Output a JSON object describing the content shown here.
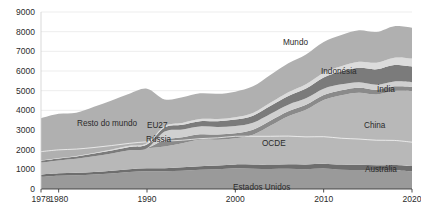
{
  "chart_data": {
    "type": "area",
    "stacked": true,
    "title": "",
    "subtitle": "",
    "xlabel": "",
    "ylabel": "",
    "xlim": [
      1978,
      2020
    ],
    "ylim": [
      0,
      9000
    ],
    "grid": true,
    "legend_position": "inline-labels",
    "x_ticks": [
      "1978",
      "1980",
      "1990",
      "2000",
      "2010",
      "2020"
    ],
    "x_tick_values": [
      1978,
      1980,
      1990,
      2000,
      2010,
      2020
    ],
    "y_ticks": [
      "0",
      "1000",
      "2000",
      "3000",
      "4000",
      "5000",
      "6000",
      "7000",
      "8000",
      "9000"
    ],
    "y_tick_values": [
      0,
      1000,
      2000,
      3000,
      4000,
      5000,
      6000,
      7000,
      8000,
      9000
    ],
    "x": [
      1978,
      1980,
      1982,
      1984,
      1986,
      1988,
      1990,
      1992,
      1994,
      1996,
      1998,
      2000,
      2002,
      2004,
      2006,
      2008,
      2010,
      2012,
      2014,
      2016,
      2018,
      2020
    ],
    "series": [
      {
        "name": "Estados Unidos",
        "color": "#9a9a9a",
        "label_color": "#2b2b2b",
        "values": [
          620,
          680,
          700,
          740,
          790,
          860,
          900,
          900,
          930,
          980,
          1000,
          1050,
          1030,
          1020,
          1030,
          1010,
          1040,
          980,
          960,
          930,
          940,
          900
        ]
      },
      {
        "name": "Austrália",
        "color": "#6e6e6e",
        "label_color": "#f2f2f2",
        "values": [
          110,
          115,
          120,
          130,
          140,
          150,
          155,
          160,
          170,
          180,
          190,
          200,
          210,
          220,
          230,
          240,
          250,
          260,
          270,
          275,
          280,
          270
        ]
      },
      {
        "name": "China",
        "color": "#b8b8b8",
        "label_color": "#2b2b2b",
        "values": [
          620,
          660,
          720,
          800,
          880,
          960,
          1020,
          1100,
          1230,
          1340,
          1320,
          1330,
          1520,
          1990,
          2440,
          2780,
          3240,
          3530,
          3670,
          3600,
          3760,
          3800
        ]
      },
      {
        "name": "Rússia",
        "color": "#8a8a8a",
        "label_color": "#2b2b2b",
        "values": [
          0,
          0,
          0,
          0,
          0,
          0,
          0,
          340,
          300,
          280,
          260,
          250,
          250,
          250,
          250,
          250,
          250,
          250,
          250,
          240,
          240,
          230
        ]
      },
      {
        "name": "EU27",
        "color": "#d0d0d0",
        "label_color": "#2b2b2b",
        "values": [
          0,
          0,
          0,
          0,
          0,
          0,
          0,
          420,
          400,
          400,
          380,
          370,
          360,
          350,
          340,
          330,
          320,
          300,
          280,
          260,
          250,
          230
        ]
      },
      {
        "name": "Índia",
        "color": "#7b7b7b",
        "label_color": "#2b2b2b",
        "values": [
          80,
          90,
          110,
          130,
          150,
          170,
          190,
          210,
          240,
          270,
          300,
          330,
          360,
          400,
          440,
          500,
          570,
          650,
          730,
          780,
          830,
          800
        ]
      },
      {
        "name": "Indonésia",
        "color": "#dcdcdc",
        "label_color": "#2b2b2b",
        "values": [
          20,
          25,
          30,
          35,
          45,
          55,
          65,
          75,
          90,
          105,
          110,
          120,
          140,
          165,
          190,
          215,
          245,
          275,
          310,
          340,
          380,
          400
        ]
      },
      {
        "name": "Resto do mundo",
        "color": "#b0b0b0",
        "label_color": "#2b2b2b",
        "values": [
          2150,
          2250,
          2200,
          2350,
          2500,
          2650,
          2770,
          1350,
          1300,
          1310,
          1280,
          1300,
          1350,
          1420,
          1480,
          1520,
          1560,
          1580,
          1600,
          1560,
          1600,
          1570
        ]
      }
    ],
    "annotations": [
      {
        "text": "Mundo",
        "note": "top boundary of total stack"
      },
      {
        "text": "OCDE",
        "note": "white dividing line inside stack"
      }
    ],
    "ocde_line": {
      "name": "OCDE",
      "color": "#ffffff",
      "values": [
        1900,
        1990,
        2030,
        2110,
        2210,
        2320,
        2400,
        2430,
        2480,
        2560,
        2600,
        2680,
        2680,
        2680,
        2690,
        2650,
        2660,
        2580,
        2540,
        2480,
        2470,
        2380
      ]
    },
    "label_positions": [
      {
        "key": "resto-do-mundo",
        "text": "Resto do mundo",
        "x": 77,
        "y": 126,
        "color": "#2b2b2b"
      },
      {
        "key": "eu27",
        "text": "EU27",
        "x": 147,
        "y": 128,
        "color": "#2b2b2b"
      },
      {
        "key": "russia",
        "text": "Rússia",
        "x": 146,
        "y": 142,
        "color": "#2b2b2b"
      },
      {
        "key": "mundo",
        "text": "Mundo",
        "x": 283,
        "y": 45,
        "color": "#2b2b2b"
      },
      {
        "key": "indonesia",
        "text": "Indonésia",
        "x": 321,
        "y": 74,
        "color": "#2b2b2b"
      },
      {
        "key": "india",
        "text": "Índia",
        "x": 377,
        "y": 92,
        "color": "#2b2b2b"
      },
      {
        "key": "china",
        "text": "China",
        "x": 364,
        "y": 128,
        "color": "#2b2b2b"
      },
      {
        "key": "ocde",
        "text": "OCDE",
        "x": 262,
        "y": 146,
        "color": "#f4f4f4"
      },
      {
        "key": "australia",
        "text": "Austrália",
        "x": 365,
        "y": 172,
        "color": "#efefef"
      },
      {
        "key": "estados-unidos",
        "text": "Estados Unidos",
        "x": 233,
        "y": 190,
        "color": "#2b2b2b"
      }
    ]
  }
}
